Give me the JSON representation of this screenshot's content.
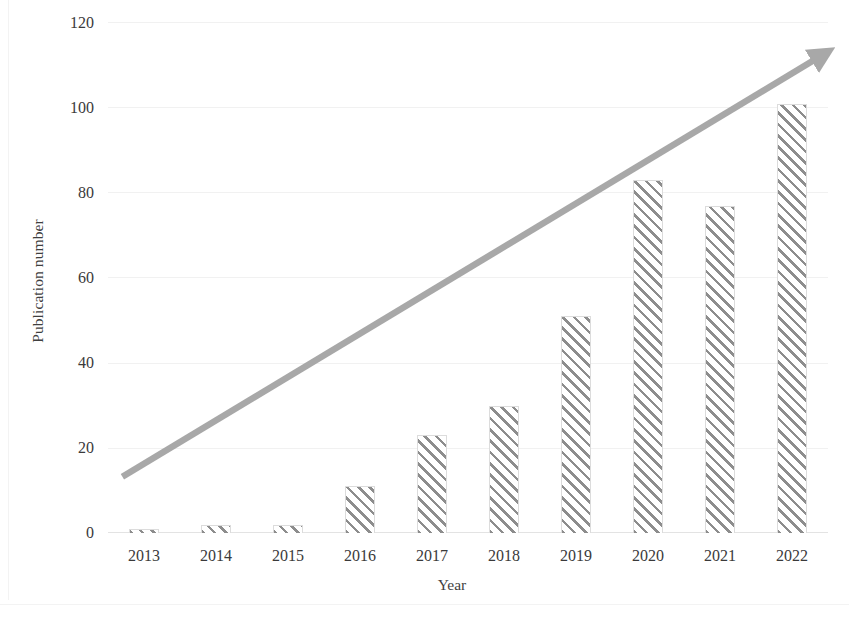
{
  "chart_data": {
    "type": "bar",
    "title": "",
    "subtitle": "",
    "xlabel": "Year",
    "ylabel": "Publication number",
    "categories": [
      "2013",
      "2014",
      "2015",
      "2016",
      "2017",
      "2018",
      "2019",
      "2020",
      "2021",
      "2022"
    ],
    "values": [
      1,
      2,
      2,
      11,
      23,
      30,
      51,
      83,
      77,
      101
    ],
    "series": [
      {
        "name": "Publication number",
        "values": [
          1,
          2,
          2,
          11,
          23,
          30,
          51,
          83,
          77,
          101
        ]
      }
    ],
    "ylim": [
      0,
      120
    ],
    "xlim_categories": 10,
    "yticks": [
      0,
      20,
      40,
      60,
      80,
      100,
      120
    ],
    "ytick_labels": [
      "0",
      "20",
      "40",
      "60",
      "80",
      "100",
      "120"
    ],
    "grid": "horizontal-faint",
    "legend": "none",
    "legend_position": "none",
    "annotations": [
      {
        "type": "arrow",
        "name": "upward-trend-arrow",
        "from_value": 13,
        "to_value": 112,
        "from_category": "2013",
        "to_category": "2022",
        "color": "#a8a8a8",
        "label": ""
      }
    ],
    "colors": {
      "bar_hatch": "#8d8d8d",
      "bar_fill": "#ffffff",
      "bar_outline": "#dcdcdc",
      "arrow": "#a8a8a8",
      "text": "#3a3a3a",
      "grid": "#f1f1f1",
      "background": "#ffffff"
    },
    "bar_style": "diagonal-hatch"
  }
}
